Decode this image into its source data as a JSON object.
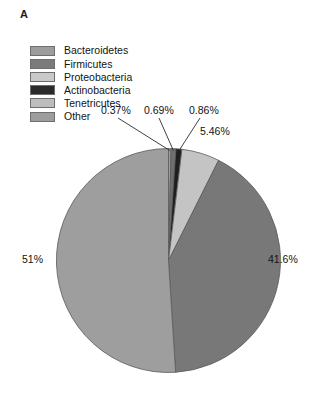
{
  "panel": {
    "label": "A"
  },
  "legend": {
    "items": [
      {
        "label": "Bacteroidetes",
        "color": "#9d9d9d",
        "swatch_name": "legend-swatch-bacteroidetes"
      },
      {
        "label": "Firmicutes",
        "color": "#7b7b7b",
        "swatch_name": "legend-swatch-firmicutes"
      },
      {
        "label": "Proteobacteria",
        "color": "#c9c9c9",
        "swatch_name": "legend-swatch-proteobacteria"
      },
      {
        "label": "Actinobacteria",
        "color": "#2b2b2b",
        "swatch_name": "legend-swatch-actinobacteria"
      },
      {
        "label": "Tenetricutes",
        "color": "#bdbdbd",
        "swatch_name": "legend-swatch-tenetricutes"
      },
      {
        "label": "Other",
        "color": "#9d9d9d",
        "swatch_name": "legend-swatch-other"
      }
    ]
  },
  "chart_data": {
    "type": "pie",
    "title": "A",
    "xlabel": "",
    "ylabel": "",
    "legend_position": "top-left",
    "grid": false,
    "start_angle_deg": 0,
    "direction": "clockwise",
    "categories": [
      "Bacteroidetes",
      "Firmicutes",
      "Proteobacteria",
      "Actinobacteria",
      "Tenetricutes",
      "Other"
    ],
    "values": [
      0.37,
      41.6,
      0.69,
      0.86,
      5.46,
      51
    ],
    "slice_order_clockwise_from_top": [
      {
        "name": "Bacteroidetes",
        "value": 0.37,
        "label": "0.37%",
        "color": "#9d9d9d",
        "leader_line": true
      },
      {
        "name": "Proteobacteria",
        "value": 0.69,
        "label": "0.69%",
        "color": "#6f6f6f",
        "leader_line": true
      },
      {
        "name": "Actinobacteria",
        "value": 0.86,
        "label": "0.86%",
        "color": "#1f1f1f",
        "leader_line": true
      },
      {
        "name": "Tenetricutes",
        "value": 5.46,
        "label": "5.46%",
        "color": "#c4c4c4",
        "leader_line": false
      },
      {
        "name": "Firmicutes",
        "value": 41.6,
        "label": "41.6%",
        "color": "#787878",
        "leader_line": false
      },
      {
        "name": "Other",
        "value": 51,
        "label": "51%",
        "color": "#9e9e9e",
        "leader_line": false
      }
    ],
    "labels": [
      "0.37%",
      "0.69%",
      "0.86%",
      "5.46%",
      "41.6%",
      "51%"
    ],
    "units": "percent",
    "total": 99.98
  }
}
